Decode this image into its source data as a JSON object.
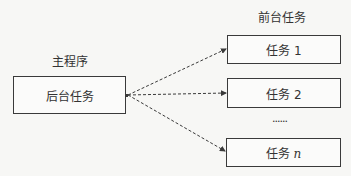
{
  "main_program": {
    "group_label": "主程序",
    "box_label": "后台任务"
  },
  "foreground": {
    "group_label": "前台任务",
    "tasks": [
      {
        "prefix": "任务",
        "index": "1"
      },
      {
        "prefix": "任务",
        "index": "2"
      },
      {
        "prefix": "任务",
        "index": "n"
      }
    ],
    "ellipsis": "......"
  },
  "colors": {
    "line": "#3a3a3a",
    "background": "#f7f7f5"
  }
}
